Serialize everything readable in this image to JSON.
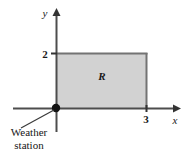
{
  "figure": {
    "type": "coordinate-diagram",
    "width": 191,
    "height": 159,
    "background_color": "#ffffff",
    "axes": {
      "x_axis_label": "x",
      "y_axis_label": "y",
      "origin_label": "",
      "x_tick_labels": [
        "3"
      ],
      "y_tick_labels": [
        "2"
      ],
      "axis_color": "#4d4d4d"
    },
    "region": {
      "label": "R",
      "x_from": 0,
      "x_to": 3,
      "y_from": 0,
      "y_to": 2,
      "fill_color": "#d2d2d2",
      "border_color": "#6e6e6e"
    },
    "callout": {
      "line1": "Weather",
      "line2": "station",
      "marker": "origin-point",
      "marker_color": "#1a1a1a"
    }
  }
}
